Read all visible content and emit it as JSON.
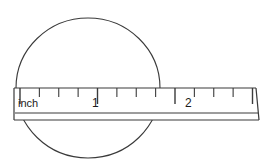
{
  "figure": {
    "background_color": "#ffffff",
    "stroke_color": "#3a3a3a",
    "text_color": "#1a1a1a",
    "ruler": {
      "unit_label": "inch",
      "numbers": [
        "1",
        "2"
      ],
      "number_1": "1",
      "number_2": "2",
      "left_x": 14,
      "right_x": 256,
      "top_y": 88,
      "bottom_y": 120,
      "scale_line_y": 88,
      "inner_line_y": 113,
      "origin_x": 20,
      "inch_px": 77.5,
      "major_tick_len": 16,
      "minor_tick_len": 9,
      "ticks_per_inch": 4,
      "tick_positions_inches": [
        0,
        0.25,
        0.5,
        0.75,
        1,
        1.25,
        1.5,
        1.75,
        2,
        2.25,
        2.5,
        2.75,
        3
      ],
      "major_ticks_inches": [
        0,
        1,
        2,
        3
      ]
    },
    "oval": {
      "center_x": 88,
      "center_y": 88,
      "radius_x": 72,
      "radius_y": 70,
      "measured_width_inches": "1.8"
    }
  }
}
